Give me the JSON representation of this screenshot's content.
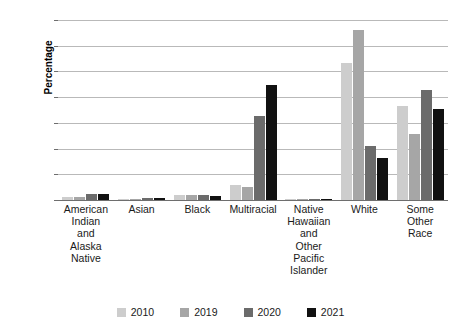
{
  "chart_data": {
    "type": "bar",
    "title": "",
    "xlabel": "",
    "ylabel": "Percentage",
    "ylim": [
      0,
      70
    ],
    "ytick_values": [
      0,
      10,
      20,
      30,
      40,
      50,
      60,
      70
    ],
    "ytick_labels": [
      "0.0",
      "10.0",
      "20.0",
      "30.0",
      "40.0",
      "50.0",
      "60.0",
      "70.0"
    ],
    "grid": true,
    "legend_position": "bottom",
    "categories": [
      "American Indian and Alaska Native",
      "Asian",
      "Black",
      "Multiracial",
      "Native Hawaiian and Other Pacific Islander",
      "White",
      "Some Other Race"
    ],
    "category_labels": [
      "American\nIndian\nand\nAlaska\nNative",
      "Asian",
      "Black",
      "Multiracial",
      "Native\nHawaiian\nand\nOther\nPacific\nIslander",
      "White",
      "Some Other\nRace"
    ],
    "series": [
      {
        "name": "2010",
        "color": "#cdcdcd",
        "values": [
          1.0,
          0.3,
          1.9,
          6.0,
          0.2,
          53.2,
          36.7
        ]
      },
      {
        "name": "2019",
        "color": "#a6a6a6",
        "values": [
          1.2,
          0.5,
          2.1,
          5.0,
          0.3,
          66.0,
          25.8
        ]
      },
      {
        "name": "2020",
        "color": "#6b6b6b",
        "values": [
          2.2,
          0.6,
          2.0,
          32.7,
          0.3,
          21.0,
          42.8
        ]
      },
      {
        "name": "2021",
        "color": "#111111",
        "values": [
          2.3,
          0.8,
          1.6,
          44.8,
          0.3,
          16.5,
          35.4
        ]
      }
    ]
  },
  "legend": {
    "items": [
      {
        "label": "2010",
        "color": "#cdcdcd"
      },
      {
        "label": "2019",
        "color": "#a6a6a6"
      },
      {
        "label": "2020",
        "color": "#6b6b6b"
      },
      {
        "label": "2021",
        "color": "#111111"
      }
    ]
  },
  "axis": {
    "y_title": "Percentage"
  },
  "colors": {
    "gridline": "#b9b9b9",
    "axis": "#6e6e6e",
    "text": "#1a1a1a",
    "background": "#ffffff"
  }
}
